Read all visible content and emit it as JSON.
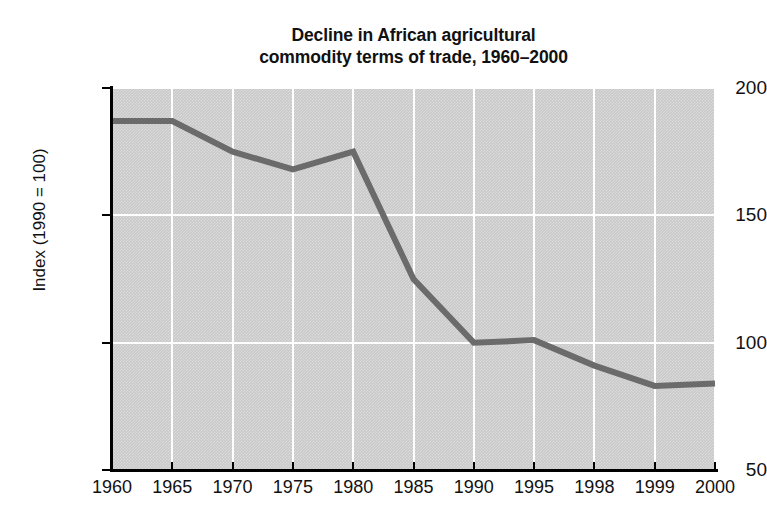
{
  "chart_data": {
    "type": "line",
    "title": "Decline in African agricultural commodity terms of trade, 1960–2000",
    "title_lines": [
      "Decline in African agricultural",
      "commodity terms of trade, 1960–2000"
    ],
    "xlabel": "",
    "ylabel": "Index (1990 = 100)",
    "categories": [
      "1960",
      "1965",
      "1970",
      "1975",
      "1980",
      "1985",
      "1990",
      "1995",
      "1998",
      "1999",
      "2000"
    ],
    "values": [
      187,
      187,
      175,
      168,
      175,
      125,
      100,
      101,
      91,
      83,
      84
    ],
    "series": [
      {
        "name": "Index (1990 = 100)",
        "values": [
          187,
          187,
          175,
          168,
          175,
          125,
          100,
          101,
          91,
          83,
          84
        ]
      }
    ],
    "ylim": [
      50,
      200
    ],
    "yticks": [
      50,
      100,
      150,
      200
    ],
    "ytick_labels": [
      "50",
      "100",
      "150",
      "200"
    ],
    "grid": true,
    "grid_color": "#ffffff",
    "legend": false,
    "legend_position": "none",
    "plot_background": "#c9c9c9",
    "line_color": "#6b6b6b",
    "line_width": 6,
    "text_color": "#111111",
    "axis_color": "#000000",
    "page_background": "#ffffff"
  }
}
